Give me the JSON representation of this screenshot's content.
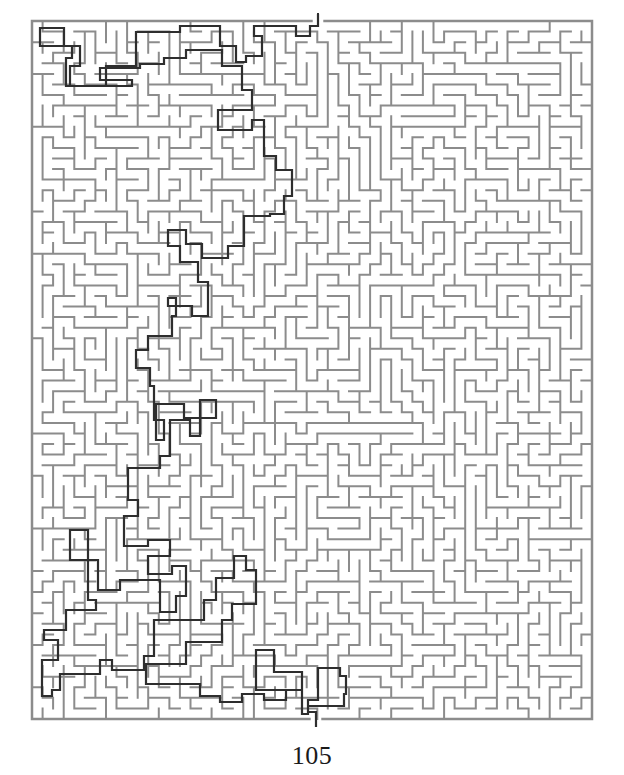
{
  "page": {
    "page_number": "105",
    "background": "#ffffff"
  },
  "maze": {
    "bounds": {
      "x": 32,
      "y": 21,
      "width": 560,
      "height": 698
    },
    "cols": 53,
    "rows": 66,
    "seed": 105,
    "wall_color": "#8c8c8c",
    "wall_width": 2,
    "entrance": {
      "x": 318,
      "y_top": 13,
      "y_bottom": 21,
      "col": 27
    },
    "exit": {
      "x": 316,
      "y_top": 719,
      "y_bottom": 727,
      "col": 26
    }
  },
  "solution": {
    "color": "#2e2e2e",
    "width": 2.2,
    "points": [
      [
        318,
        14
      ],
      [
        318,
        26
      ],
      [
        310,
        26
      ],
      [
        310,
        36
      ],
      [
        296,
        36
      ],
      [
        296,
        26
      ],
      [
        254,
        26
      ],
      [
        254,
        36
      ],
      [
        262,
        36
      ],
      [
        262,
        56
      ],
      [
        246,
        56
      ],
      [
        246,
        62
      ],
      [
        236,
        62
      ],
      [
        236,
        46
      ],
      [
        220,
        46
      ],
      [
        220,
        26
      ],
      [
        180,
        26
      ],
      [
        180,
        32
      ],
      [
        136,
        32
      ],
      [
        136,
        66
      ],
      [
        106,
        66
      ],
      [
        106,
        86
      ],
      [
        70,
        86
      ],
      [
        70,
        66
      ],
      [
        80,
        66
      ],
      [
        80,
        46
      ],
      [
        64,
        46
      ],
      [
        64,
        28
      ],
      [
        40,
        28
      ],
      [
        40,
        46
      ],
      [
        72,
        46
      ],
      [
        72,
        58
      ],
      [
        66,
        58
      ],
      [
        66,
        86
      ],
      [
        132,
        86
      ],
      [
        132,
        80
      ],
      [
        100,
        80
      ],
      [
        100,
        68
      ],
      [
        140,
        68
      ],
      [
        140,
        64
      ],
      [
        164,
        64
      ],
      [
        164,
        58
      ],
      [
        186,
        58
      ],
      [
        186,
        50
      ],
      [
        222,
        50
      ],
      [
        222,
        66
      ],
      [
        242,
        66
      ],
      [
        242,
        90
      ],
      [
        252,
        90
      ],
      [
        252,
        110
      ],
      [
        218,
        110
      ],
      [
        218,
        130
      ],
      [
        252,
        130
      ],
      [
        252,
        120
      ],
      [
        264,
        120
      ],
      [
        264,
        156
      ],
      [
        276,
        156
      ],
      [
        276,
        170
      ],
      [
        292,
        170
      ],
      [
        292,
        196
      ],
      [
        284,
        196
      ],
      [
        284,
        214
      ],
      [
        270,
        214
      ],
      [
        270,
        216
      ],
      [
        244,
        216
      ],
      [
        244,
        246
      ],
      [
        228,
        246
      ],
      [
        228,
        258
      ],
      [
        202,
        258
      ],
      [
        202,
        244
      ],
      [
        186,
        244
      ],
      [
        186,
        230
      ],
      [
        168,
        230
      ],
      [
        168,
        246
      ],
      [
        180,
        246
      ],
      [
        180,
        262
      ],
      [
        198,
        262
      ],
      [
        198,
        282
      ],
      [
        208,
        282
      ],
      [
        208,
        316
      ],
      [
        192,
        316
      ],
      [
        192,
        306
      ],
      [
        168,
        306
      ],
      [
        168,
        298
      ],
      [
        176,
        298
      ],
      [
        176,
        316
      ],
      [
        172,
        316
      ],
      [
        172,
        336
      ],
      [
        148,
        336
      ],
      [
        148,
        350
      ],
      [
        136,
        350
      ],
      [
        136,
        368
      ],
      [
        150,
        368
      ],
      [
        150,
        386
      ],
      [
        154,
        386
      ],
      [
        154,
        420
      ],
      [
        164,
        420
      ],
      [
        164,
        440
      ],
      [
        156,
        440
      ],
      [
        156,
        404
      ],
      [
        184,
        404
      ],
      [
        184,
        418
      ],
      [
        216,
        418
      ],
      [
        216,
        400
      ],
      [
        200,
        400
      ],
      [
        200,
        436
      ],
      [
        190,
        436
      ],
      [
        190,
        420
      ],
      [
        170,
        420
      ],
      [
        170,
        456
      ],
      [
        160,
        456
      ],
      [
        160,
        468
      ],
      [
        128,
        468
      ],
      [
        128,
        500
      ],
      [
        138,
        500
      ],
      [
        138,
        516
      ],
      [
        124,
        516
      ],
      [
        124,
        546
      ],
      [
        148,
        546
      ],
      [
        148,
        540
      ],
      [
        170,
        540
      ],
      [
        170,
        556
      ],
      [
        148,
        556
      ],
      [
        148,
        574
      ],
      [
        172,
        574
      ],
      [
        172,
        566
      ],
      [
        186,
        566
      ],
      [
        186,
        596
      ],
      [
        176,
        596
      ],
      [
        176,
        612
      ],
      [
        160,
        612
      ],
      [
        160,
        580
      ],
      [
        120,
        580
      ],
      [
        120,
        590
      ],
      [
        98,
        590
      ],
      [
        98,
        560
      ],
      [
        70,
        560
      ],
      [
        70,
        530
      ],
      [
        88,
        530
      ],
      [
        88,
        600
      ],
      [
        96,
        600
      ],
      [
        96,
        610
      ],
      [
        66,
        610
      ],
      [
        66,
        630
      ],
      [
        44,
        630
      ],
      [
        44,
        640
      ],
      [
        58,
        640
      ],
      [
        58,
        660
      ],
      [
        42,
        660
      ],
      [
        42,
        696
      ],
      [
        52,
        696
      ],
      [
        52,
        690
      ],
      [
        60,
        690
      ],
      [
        60,
        674
      ],
      [
        100,
        674
      ],
      [
        100,
        660
      ],
      [
        112,
        660
      ],
      [
        112,
        670
      ],
      [
        144,
        670
      ],
      [
        144,
        656
      ],
      [
        154,
        656
      ],
      [
        154,
        620
      ],
      [
        204,
        620
      ],
      [
        204,
        600
      ],
      [
        216,
        600
      ],
      [
        216,
        578
      ],
      [
        234,
        578
      ],
      [
        234,
        556
      ],
      [
        246,
        556
      ],
      [
        246,
        570
      ],
      [
        256,
        570
      ],
      [
        256,
        604
      ],
      [
        232,
        604
      ],
      [
        232,
        620
      ],
      [
        222,
        620
      ],
      [
        222,
        642
      ],
      [
        186,
        642
      ],
      [
        186,
        664
      ],
      [
        146,
        664
      ],
      [
        146,
        684
      ],
      [
        200,
        684
      ],
      [
        200,
        696
      ],
      [
        220,
        696
      ],
      [
        220,
        702
      ],
      [
        242,
        702
      ],
      [
        242,
        694
      ],
      [
        264,
        694
      ],
      [
        264,
        700
      ],
      [
        286,
        700
      ],
      [
        286,
        690
      ],
      [
        302,
        690
      ],
      [
        302,
        672
      ],
      [
        274,
        672
      ],
      [
        274,
        650
      ],
      [
        256,
        650
      ],
      [
        256,
        690
      ],
      [
        302,
        690
      ],
      [
        302,
        714
      ],
      [
        308,
        714
      ],
      [
        308,
        706
      ],
      [
        344,
        706
      ],
      [
        344,
        694
      ],
      [
        346,
        694
      ],
      [
        346,
        676
      ],
      [
        340,
        676
      ],
      [
        340,
        668
      ],
      [
        318,
        668
      ],
      [
        318,
        700
      ],
      [
        308,
        700
      ],
      [
        308,
        712
      ],
      [
        316,
        712
      ],
      [
        316,
        727
      ]
    ]
  }
}
